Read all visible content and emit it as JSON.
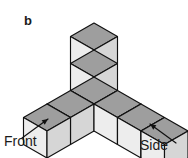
{
  "figure": {
    "panel_label": "b",
    "background_color": "#ffffff",
    "outline_color": "#111111",
    "face_colors": {
      "top": "#9e9e9e",
      "left": "#ededed",
      "right": "#d6d6d6"
    },
    "annotations": [
      {
        "id": "front",
        "label": "Front",
        "x": 4,
        "y": 146,
        "arrow_from": [
          22,
          138
        ],
        "arrow_to": [
          48,
          119
        ]
      },
      {
        "id": "side",
        "label": "Side",
        "x": 140,
        "y": 150,
        "arrow_from": [
          176,
          143
        ],
        "arrow_to": [
          150,
          124
        ]
      }
    ],
    "projection": {
      "type": "isometric",
      "origin": [
        94,
        104
      ],
      "unit_x": [
        23.5,
        13.5
      ],
      "unit_y": [
        -23.5,
        13.5
      ],
      "unit_z": [
        0,
        -27
      ]
    },
    "cubes": [
      {
        "id": "center",
        "x": 0,
        "y": 0,
        "z": 0
      },
      {
        "id": "left-arm-1",
        "x": 0,
        "y": 1,
        "z": 0
      },
      {
        "id": "left-arm-2",
        "x": 0,
        "y": 2,
        "z": 0
      },
      {
        "id": "right-arm-1",
        "x": 1,
        "y": 0,
        "z": 0
      },
      {
        "id": "right-arm-2",
        "x": 2,
        "y": 0,
        "z": 0
      },
      {
        "id": "right-arm-3",
        "x": 3,
        "y": 0,
        "z": 0
      },
      {
        "id": "stack-1",
        "x": 0,
        "y": 0,
        "z": 1
      },
      {
        "id": "stack-2",
        "x": 0,
        "y": 0,
        "z": 2
      }
    ],
    "cube_count": 8
  }
}
